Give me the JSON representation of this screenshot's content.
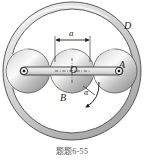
{
  "figure": {
    "kind": "mechanics-diagram",
    "caption": {
      "prefix_cjk": "题题",
      "number": "6-55",
      "full": "题题 6-55"
    },
    "background_color": "#ffffff",
    "ink_color": "#1a1a1a",
    "ring": {
      "name": "outer-ring",
      "label": "D",
      "label_x": 127,
      "label_y": 27,
      "center_x": 72,
      "center_y": 71,
      "outer_radius": 69,
      "inner_radius": 62,
      "fill_light": "#e8e8e8",
      "fill_dark": "#b4b4b4",
      "stroke": "#3c3c3c"
    },
    "discs": [
      {
        "name": "disc-left",
        "label": "",
        "center_x": 28,
        "center_y": 71,
        "radius": 22,
        "pin_x": 24,
        "pin_y": 71
      },
      {
        "name": "disc-middle",
        "label": "B",
        "label_x": 63,
        "label_y": 98,
        "center_x": 72,
        "center_y": 71,
        "radius": 22,
        "pin_x": 72,
        "pin_y": 71
      },
      {
        "name": "disc-right",
        "label": "A",
        "label_x": 122,
        "label_y": 66,
        "center_x": 115,
        "center_y": 71,
        "radius": 22,
        "pin_x": 119,
        "pin_y": 71
      }
    ],
    "center_point": {
      "name": "center-O",
      "label": "O",
      "label_x": 73,
      "label_y": 70
    },
    "link": {
      "name": "connecting-link",
      "from_x": 24,
      "from_y": 71,
      "to_x": 119,
      "to_y": 71,
      "half_height": 4,
      "fill": "#dcdcdc",
      "stroke": "#2a2a2a"
    },
    "dimension": {
      "name": "dimension-a",
      "label": "a",
      "label_x": 72,
      "label_y": 33,
      "line_y": 40,
      "left_x": 55,
      "right_x": 90,
      "ext_bottom_y": 62
    },
    "angular_acceleration": {
      "name": "alpha-arrow",
      "label": "α",
      "label_x": 86,
      "label_y": 92,
      "arc_start_x": 97,
      "arc_start_y": 84,
      "arc_end_x": 86,
      "arc_end_y": 108
    }
  }
}
